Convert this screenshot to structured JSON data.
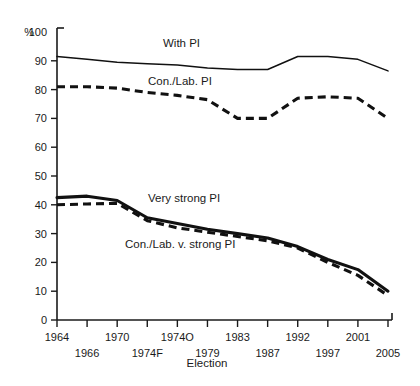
{
  "chart_data": {
    "type": "line",
    "title": "",
    "xlabel": "Election",
    "ylabel": "%",
    "y_unit_label": "%",
    "ylim": [
      0,
      100
    ],
    "grid": false,
    "legend_position": "inline",
    "categories": [
      "1964",
      "1966",
      "1970",
      "1974F",
      "1974O",
      "1979",
      "1983",
      "1987",
      "1992",
      "1997",
      "2001",
      "2005"
    ],
    "x_ticks_upper": [
      "1964",
      "1970",
      "1974O",
      "1983",
      "1992",
      "2001"
    ],
    "x_ticks_lower": [
      "1966",
      "1974F",
      "1979",
      "1987",
      "1997",
      "2005"
    ],
    "y_ticks": [
      "0",
      "10",
      "20",
      "30",
      "40",
      "50",
      "60",
      "70",
      "80",
      "90",
      "100"
    ],
    "series": [
      {
        "name": "With PI",
        "style": "solid-thin",
        "label": "With PI",
        "values": [
          91.5,
          90.5,
          89.5,
          89.0,
          88.5,
          87.5,
          87.0,
          87.0,
          91.5,
          91.5,
          90.5,
          86.5
        ]
      },
      {
        "name": "Con./Lab. PI",
        "style": "dashed",
        "label": "Con./Lab. PI",
        "values": [
          81.0,
          81.0,
          80.5,
          79.0,
          78.0,
          76.5,
          70.0,
          70.0,
          77.0,
          77.5,
          77.0,
          70.0
        ]
      },
      {
        "name": "Very strong PI",
        "style": "solid-thick",
        "label": "Very strong PI",
        "values": [
          42.5,
          43.0,
          41.5,
          35.5,
          33.5,
          31.5,
          30.0,
          28.5,
          25.5,
          21.0,
          17.5,
          10.0
        ]
      },
      {
        "name": "Con./Lab. v. strong PI",
        "style": "dashed",
        "label": "Con./Lab. v. strong PI",
        "values": [
          40.0,
          40.3,
          40.5,
          34.5,
          32.0,
          30.5,
          29.0,
          27.5,
          25.0,
          20.0,
          15.5,
          8.5
        ]
      }
    ],
    "inline_labels": [
      {
        "text": "With PI",
        "x": 163,
        "y": 47
      },
      {
        "text": "Con./Lab. PI",
        "x": 148,
        "y": 85
      },
      {
        "text": "Very strong PI",
        "x": 148,
        "y": 202
      },
      {
        "text": "Con./Lab. v. strong PI",
        "x": 125,
        "y": 248
      }
    ]
  }
}
